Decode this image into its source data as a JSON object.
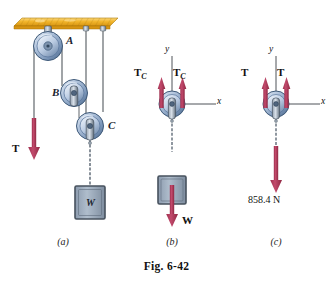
{
  "figure": {
    "caption": "Fig. 6-42",
    "panels": [
      {
        "id": "a",
        "label": "(a)"
      },
      {
        "id": "b",
        "label": "(b)"
      },
      {
        "id": "c",
        "label": "(c)"
      }
    ]
  },
  "colors": {
    "arrow": "#B03A5B",
    "arrow_dark": "#8E2A46",
    "ceiling": "#F0B429",
    "ceiling_edge": "#C98A10",
    "pulley_body": "#9FB4D0",
    "pulley_rim": "#6F8CAE",
    "pulley_dark": "#3E5978",
    "rope": "#6E7378",
    "axis": "#3A3F45",
    "block_fill": "#9BA9BA",
    "block_edge": "#47525E",
    "text": "#111111"
  },
  "panel_a": {
    "label": "(a)",
    "pulleys": [
      {
        "name": "A",
        "label": "A"
      },
      {
        "name": "B",
        "label": "B"
      },
      {
        "name": "C",
        "label": "C"
      }
    ],
    "forces": [
      {
        "name": "T",
        "label": "T",
        "direction": "down"
      }
    ],
    "block": {
      "label": "W"
    },
    "ceiling": {
      "name": "ceiling-beam"
    }
  },
  "panel_b": {
    "label": "(b)",
    "axes": {
      "x": "x",
      "y": "y"
    },
    "forces": [
      {
        "name": "T_C-left",
        "label": "T",
        "subscript": "C",
        "direction": "up"
      },
      {
        "name": "T_C-right",
        "label": "T",
        "subscript": "C",
        "direction": "up"
      },
      {
        "name": "W",
        "label": "W",
        "subscript": "",
        "direction": "down"
      }
    ],
    "block": {
      "label": ""
    }
  },
  "panel_c": {
    "label": "(c)",
    "axes": {
      "x": "x",
      "y": "y"
    },
    "forces": [
      {
        "name": "T-left",
        "label": "T",
        "subscript": "",
        "direction": "up"
      },
      {
        "name": "T-right",
        "label": "T",
        "subscript": "",
        "direction": "up"
      },
      {
        "name": "weight",
        "label": "858.4 N",
        "direction": "down"
      }
    ],
    "value": "858.4 N"
  }
}
